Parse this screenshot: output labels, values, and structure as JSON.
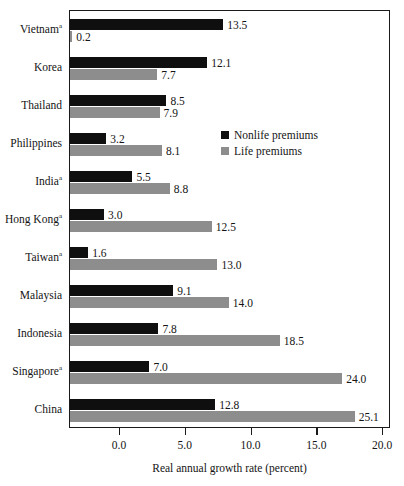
{
  "chart_data": {
    "type": "bar",
    "orientation": "horizontal",
    "title": "",
    "xlabel": "Real annual growth rate (percent)",
    "ylabel": "",
    "categories": [
      "Vietnam",
      "Korea",
      "Thailand",
      "Philippines",
      "India",
      "Hong Kong",
      "Taiwan",
      "Malaysia",
      "Indonesia",
      "Singapore",
      "China"
    ],
    "category_footnote_marks": [
      "a",
      "",
      "",
      "",
      "a",
      "a",
      "a",
      "",
      "",
      "a",
      ""
    ],
    "series": [
      {
        "name": "Nonlife premiums",
        "color": "#100f0f",
        "values": [
          13.5,
          12.1,
          8.5,
          3.2,
          5.5,
          3.0,
          1.6,
          9.1,
          7.8,
          7.0,
          12.8
        ]
      },
      {
        "name": "Life premiums",
        "color": "#8d8d8d",
        "values": [
          0.2,
          7.7,
          7.9,
          8.1,
          8.8,
          12.5,
          13.0,
          14.0,
          18.5,
          24.0,
          25.1
        ]
      }
    ],
    "xticks": [
      0.0,
      5.0,
      10.0,
      15.0,
      20.0
    ],
    "xtick_labels": [
      "0.0",
      "5.0",
      "10.0",
      "15.0",
      "20.0"
    ],
    "xlim": [
      0,
      28.3
    ],
    "grid": false,
    "legend_position": "inside-upper-center"
  },
  "legend": {
    "items": [
      {
        "label": "Nonlife premiums",
        "color": "#100f0f"
      },
      {
        "label": "Life premiums",
        "color": "#8d8d8d"
      }
    ]
  },
  "axis": {
    "x_title": "Real annual growth rate (percent)"
  }
}
